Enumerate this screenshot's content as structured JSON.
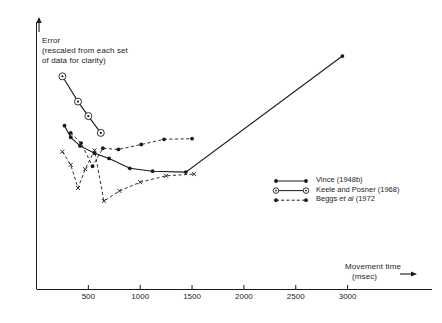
{
  "chart_data": {
    "type": "line",
    "title": "",
    "ylabel": "Error",
    "ylabel_note": "(rescaled from each set\nof data for clarity)",
    "xlabel": "Movement time",
    "xunit": "(msec)",
    "grid": false,
    "legend_position": "center-right",
    "xlim": [
      0,
      3150
    ],
    "ylim": [
      0,
      1
    ],
    "xticks": [
      500,
      1000,
      1500,
      2000,
      2500,
      3000
    ],
    "xticklabels": [
      "500",
      "1000",
      "1500",
      "2000",
      "2500",
      "3000"
    ],
    "yticks": [],
    "series": [
      {
        "name": "Vince (1948b)",
        "style": "solid",
        "marker": "filled-circle",
        "points": [
          {
            "x": 270,
            "y": 0.565
          },
          {
            "x": 330,
            "y": 0.525
          },
          {
            "x": 420,
            "y": 0.495
          },
          {
            "x": 560,
            "y": 0.47
          },
          {
            "x": 700,
            "y": 0.452
          },
          {
            "x": 900,
            "y": 0.418
          },
          {
            "x": 1120,
            "y": 0.408
          },
          {
            "x": 1440,
            "y": 0.405
          },
          {
            "x": 2950,
            "y": 0.805
          }
        ]
      },
      {
        "name": "Keele and Posner (1968)",
        "style": "solid",
        "marker": "open-circle",
        "points": [
          {
            "x": 250,
            "y": 0.735
          },
          {
            "x": 400,
            "y": 0.648
          },
          {
            "x": 500,
            "y": 0.598
          },
          {
            "x": 620,
            "y": 0.54
          }
        ]
      },
      {
        "name": "Beggs et al (1972",
        "style": "dashed",
        "marker": "filled-circle",
        "points": [
          {
            "x": 330,
            "y": 0.54
          },
          {
            "x": 430,
            "y": 0.505
          },
          {
            "x": 540,
            "y": 0.425
          },
          {
            "x": 640,
            "y": 0.487
          },
          {
            "x": 790,
            "y": 0.483
          },
          {
            "x": 1010,
            "y": 0.5
          },
          {
            "x": 1230,
            "y": 0.518
          },
          {
            "x": 1500,
            "y": 0.52
          }
        ]
      },
      {
        "name": "fourth-series",
        "style": "dashed",
        "marker": "cross",
        "points": [
          {
            "x": 250,
            "y": 0.475
          },
          {
            "x": 330,
            "y": 0.43
          },
          {
            "x": 400,
            "y": 0.35
          },
          {
            "x": 470,
            "y": 0.415
          },
          {
            "x": 560,
            "y": 0.48
          },
          {
            "x": 650,
            "y": 0.305
          },
          {
            "x": 800,
            "y": 0.34
          },
          {
            "x": 1000,
            "y": 0.37
          },
          {
            "x": 1250,
            "y": 0.392
          },
          {
            "x": 1520,
            "y": 0.398
          }
        ]
      }
    ]
  },
  "axes": {
    "y_arrow": "up-arrow",
    "x_arrow": "right-arrow"
  },
  "legend": {
    "items": [
      {
        "label": "Vince (1948b)",
        "marker": "filled-circle",
        "style": "solid"
      },
      {
        "label": "Keele and Posner (1968)",
        "marker": "open-circle",
        "style": "solid"
      },
      {
        "label": "Beggs et al (1972",
        "marker": "filled-circle",
        "style": "dashed"
      }
    ]
  }
}
